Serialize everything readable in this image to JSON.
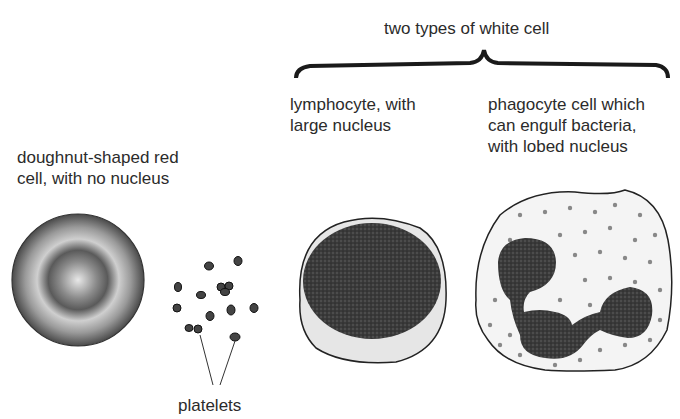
{
  "diagram": {
    "group_label": "two types of white cell",
    "cells": [
      {
        "id": "red-cell",
        "label": "doughnut-shaped red\ncell, with no nucleus"
      },
      {
        "id": "platelets",
        "label": "platelets"
      },
      {
        "id": "lymphocyte",
        "label": "lymphocyte, with\nlarge nucleus"
      },
      {
        "id": "phagocyte",
        "label": "phagocyte cell which\ncan engulf bacteria,\nwith lobed nucleus"
      }
    ]
  }
}
